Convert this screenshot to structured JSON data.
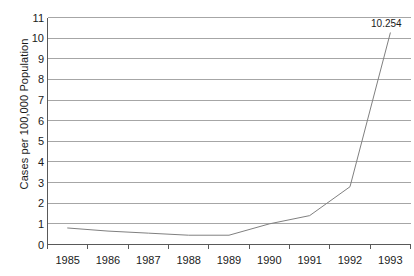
{
  "chart_data": {
    "type": "line",
    "title": "",
    "subtitle": "",
    "xlabel": "",
    "ylabel": "Cases per 100,000 Population",
    "categories": [
      "1985",
      "1986",
      "1987",
      "1988",
      "1989",
      "1990",
      "1991",
      "1992",
      "1993"
    ],
    "series": [
      {
        "name": "Cases per 100,000 Population",
        "values": [
          0.8,
          0.65,
          0.55,
          0.45,
          0.45,
          1.0,
          1.4,
          2.8,
          10.254
        ]
      }
    ],
    "ylim": [
      0,
      11
    ],
    "yticks": [
      0,
      1,
      2,
      3,
      4,
      5,
      6,
      7,
      8,
      9,
      10,
      11
    ],
    "ytick_labels": [
      "0",
      "1",
      "2",
      "3",
      "4",
      "5",
      "6",
      "7",
      "8",
      "9",
      "10",
      "11"
    ],
    "grid": true,
    "grid_axis": "y",
    "legend": false,
    "legend_position": "none",
    "annotations": [
      {
        "text": "10.254",
        "category": "1993",
        "value": 10.254
      }
    ],
    "colors": {
      "line": "#808080",
      "grid": "#a6a6a6",
      "axis": "#595959",
      "background": "#ffffff",
      "text": "#1a1a1a"
    }
  }
}
